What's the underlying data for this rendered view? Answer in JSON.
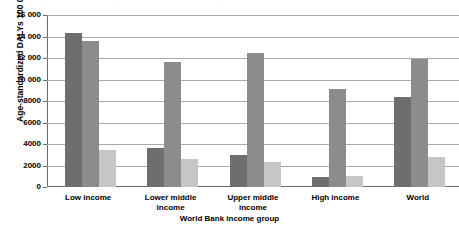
{
  "chart_data": {
    "type": "bar",
    "title": "",
    "subtitle": "",
    "xlabel": "World Bank income group",
    "ylabel": "Age-standardized DALYs 100 000",
    "ylim": [
      0,
      16000
    ],
    "ytick_labels": [
      "0",
      "2000",
      "4000",
      "6000",
      "8000",
      "10 000",
      "12 000",
      "14 000",
      "16 000"
    ],
    "ytick_values": [
      0,
      2000,
      4000,
      6000,
      8000,
      10000,
      12000,
      14000,
      16000
    ],
    "ytick_step": 2000,
    "grid": "horizontal",
    "legend_position": "top-cropped",
    "categories": [
      "Low income",
      "Lower middle income",
      "Upper middle income",
      "High income",
      "World"
    ],
    "category_lines": [
      [
        "Low income"
      ],
      [
        "Lower middle",
        "income"
      ],
      [
        "Upper middle",
        "income"
      ],
      [
        "High income"
      ],
      [
        "World"
      ]
    ],
    "series": [
      {
        "name": "series-1",
        "color": "#6e6e6e",
        "values": [
          14300,
          3600,
          3000,
          900,
          8400
        ]
      },
      {
        "name": "series-2",
        "color": "#8c8c8c",
        "values": [
          13600,
          11600,
          12500,
          9100,
          11900
        ]
      },
      {
        "name": "series-3",
        "color": "#c6c6c6",
        "values": [
          3400,
          2600,
          2300,
          1000,
          2800
        ]
      }
    ]
  },
  "axis": {
    "y_title": "Age-standardized DALYs 100 000",
    "x_title": "World Bank income group"
  }
}
